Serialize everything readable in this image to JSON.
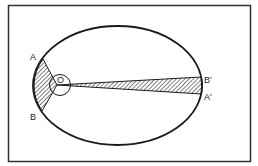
{
  "diagram": {
    "title": "",
    "labels": {
      "A": "A",
      "B": "B",
      "O": "O",
      "A_prime": "A'",
      "B_prime": "B'"
    },
    "colors": {
      "stroke": "#1a1a1a",
      "background": "#ffffff",
      "hatch": "#1a1a1a"
    }
  }
}
